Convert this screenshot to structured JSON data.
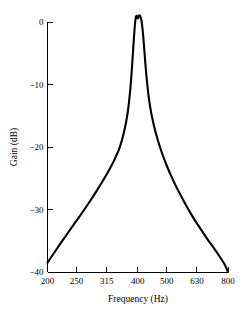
{
  "chart_data": {
    "type": "line",
    "title": "",
    "xlabel": "Frequency (Hz)",
    "ylabel": "Gain (dB)",
    "xscale": "log",
    "yscale": "linear",
    "xlim": [
      200,
      800
    ],
    "ylim": [
      -40,
      2
    ],
    "grid": false,
    "legend": null,
    "xticks": [
      200,
      250,
      315,
      400,
      500,
      630,
      800
    ],
    "xtick_labels": [
      "200",
      "250",
      "315",
      "400",
      "500",
      "630",
      "800"
    ],
    "yticks": [
      0,
      -10,
      -20,
      -30,
      -40
    ],
    "ytick_labels": [
      "0",
      "−10",
      "−20",
      "−30",
      "−40"
    ],
    "series": [
      {
        "name": "Gain",
        "color": "#000000",
        "x": [
          200,
          210,
          222,
          235,
          248,
          262,
          276,
          291,
          306,
          320,
          334,
          348,
          360,
          370,
          378,
          384,
          388,
          391,
          394,
          397,
          400,
          403,
          406,
          409,
          412,
          415,
          419,
          424,
          431,
          440,
          452,
          466,
          482,
          500,
          520,
          542,
          566,
          592,
          620,
          650,
          682,
          716,
          752,
          780,
          800
        ],
        "y": [
          -38.5,
          -37.0,
          -35.3,
          -33.6,
          -32.0,
          -30.4,
          -28.8,
          -27.1,
          -25.4,
          -23.8,
          -22.1,
          -20.1,
          -17.6,
          -14.6,
          -10.6,
          -6.2,
          -2.9,
          -0.7,
          0.7,
          1.0,
          0.55,
          0.95,
          1.05,
          0.75,
          0.1,
          -1.1,
          -3.4,
          -6.6,
          -10.3,
          -13.6,
          -16.4,
          -18.8,
          -21.0,
          -23.0,
          -24.9,
          -26.7,
          -28.4,
          -30.1,
          -31.7,
          -33.2,
          -34.7,
          -36.1,
          -37.6,
          -38.8,
          -40.0
        ]
      }
    ],
    "annotations": []
  },
  "axes": {
    "x_axis_title": "Frequency (Hz)",
    "y_axis_title": "Gain (dB)"
  }
}
